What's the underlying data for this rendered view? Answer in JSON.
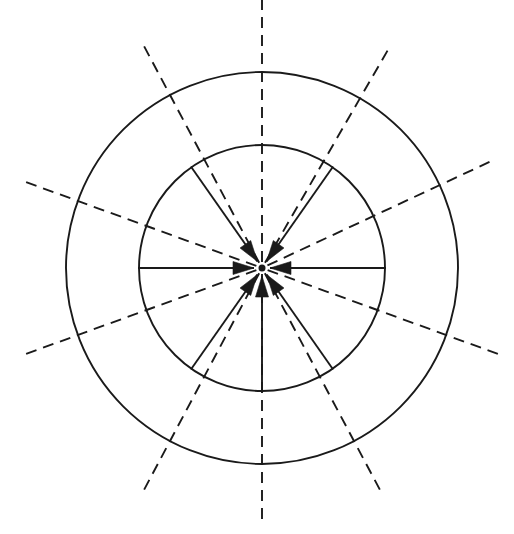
{
  "figure": {
    "canvas": {
      "width": 514,
      "height": 534,
      "background": "#ffffff"
    },
    "stroke_color": "#1a1a1a",
    "line_width": 1.9,
    "dash_pattern": "11 7",
    "center": {
      "x": 262,
      "y": 268
    },
    "circles": [
      {
        "name": "inner-circle",
        "radius": 123,
        "style": "solid"
      },
      {
        "name": "outer-circle",
        "radius": 196,
        "style": "solid"
      }
    ],
    "convergence_point": {
      "x": 262,
      "y": 268,
      "radius": 3.5
    },
    "arrows": [
      {
        "name": "arrow-up-from-below",
        "angle_deg": 90,
        "start_radius": 124,
        "end_radius": 8
      },
      {
        "name": "arrow-upright-from-lower-left",
        "angle_deg": 125,
        "start_radius": 124,
        "end_radius": 8
      },
      {
        "name": "arrow-right-from-left",
        "angle_deg": 180,
        "start_radius": 124,
        "end_radius": 8
      },
      {
        "name": "arrow-downright-from-upper-left",
        "angle_deg": 235,
        "start_radius": 124,
        "end_radius": 8
      },
      {
        "name": "arrow-downleft-from-upper-right",
        "angle_deg": 305,
        "start_radius": 124,
        "end_radius": 8
      },
      {
        "name": "arrow-left-from-right",
        "angle_deg": 0,
        "start_radius": 124,
        "end_radius": 8
      },
      {
        "name": "arrow-upleft-from-lower-right",
        "angle_deg": 55,
        "start_radius": 124,
        "end_radius": 8
      }
    ],
    "dashed_rays": [
      {
        "name": "dashed-ray-north",
        "angle_deg": 270,
        "inner_radius": 6,
        "outer_radius": 268
      },
      {
        "name": "dashed-ray-north-east",
        "angle_deg": 300,
        "inner_radius": 6,
        "outer_radius": 252
      },
      {
        "name": "dashed-ray-east-north",
        "angle_deg": 335,
        "inner_radius": 6,
        "outer_radius": 258
      },
      {
        "name": "dashed-ray-east-south",
        "angle_deg": 20,
        "inner_radius": 6,
        "outer_radius": 258
      },
      {
        "name": "dashed-ray-south-east",
        "angle_deg": 62,
        "inner_radius": 6,
        "outer_radius": 252
      },
      {
        "name": "dashed-ray-south",
        "angle_deg": 90,
        "inner_radius": 6,
        "outer_radius": 258
      },
      {
        "name": "dashed-ray-south-west",
        "angle_deg": 118,
        "inner_radius": 6,
        "outer_radius": 252
      },
      {
        "name": "dashed-ray-west-south",
        "angle_deg": 160,
        "inner_radius": 6,
        "outer_radius": 258
      },
      {
        "name": "dashed-ray-west-north",
        "angle_deg": 200,
        "inner_radius": 6,
        "outer_radius": 258
      },
      {
        "name": "dashed-ray-north-west",
        "angle_deg": 242,
        "inner_radius": 6,
        "outer_radius": 252
      }
    ],
    "arrowhead": {
      "length": 21,
      "half_width": 6.5
    }
  }
}
